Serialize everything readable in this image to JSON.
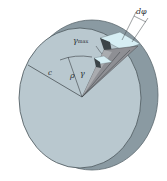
{
  "figure": {
    "labels": {
      "d_phi": "dφ",
      "gamma_max": "γ",
      "gamma_max_sub": "max",
      "radius_c": "c",
      "rho": "ρ",
      "gamma": "γ"
    },
    "colors": {
      "face": "#b9c8cf",
      "rim": "#8a9aa2",
      "rim_dark": "#6f7f87",
      "wedge_light": "#c9dde4",
      "wedge_mid": "#8e8f94",
      "wedge_dark": "#3c4448",
      "highlight": "#d6eef4",
      "line": "#3a4045"
    }
  }
}
